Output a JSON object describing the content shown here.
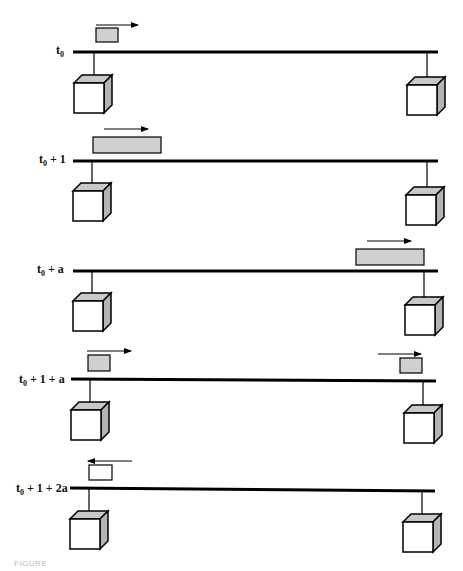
{
  "figure": {
    "type": "timing-diagram",
    "caption": "FIGURE",
    "colors": {
      "line": "#000000",
      "frame_fill": "#d0d0d0",
      "cube_side": "#b8b8b8"
    },
    "rows": [
      {
        "label_base": "t",
        "label_sub": "0",
        "label_rest": "",
        "y": 51
      },
      {
        "label_base": "t",
        "label_sub": "0",
        "label_rest": " + 1",
        "y": 161
      },
      {
        "label_base": "t",
        "label_sub": "0",
        "label_rest": " + a",
        "y": 270
      },
      {
        "label_base": "t",
        "label_sub": "0",
        "label_rest": " + 1 + a",
        "y": 380
      },
      {
        "label_base": "t",
        "label_sub": "0",
        "label_rest": " + 1 + 2a",
        "y": 490
      }
    ]
  }
}
